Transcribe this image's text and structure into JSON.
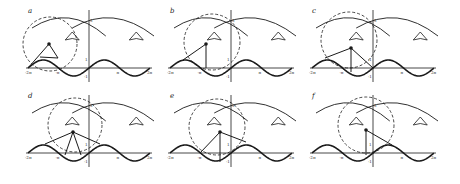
{
  "figure": {
    "stroke_color": "#1a1a1a",
    "background": "#ffffff",
    "axis_ticks": {
      "x": [
        "-2π",
        "-π",
        "π",
        "2π"
      ],
      "y": [
        "1",
        "-1",
        "5"
      ]
    },
    "panels": [
      {
        "label": "a",
        "ox": 89,
        "oy": 68,
        "circle": {
          "cx": 50,
          "cy": 44,
          "r": 27
        },
        "point": {
          "x": 49,
          "y": 44
        },
        "segments": [
          [
            28,
            68,
            49,
            44
          ],
          [
            49,
            44,
            58,
            58
          ],
          [
            40,
            57,
            58,
            58
          ]
        ]
      },
      {
        "label": "b",
        "ox": 231,
        "oy": 68,
        "circle": {
          "cx": 212,
          "cy": 42,
          "r": 28
        },
        "point": {
          "x": 206,
          "y": 44
        },
        "segments": [
          [
            183,
            60,
            206,
            44
          ],
          [
            206,
            44,
            206,
            68
          ]
        ]
      },
      {
        "label": "c",
        "ox": 373,
        "oy": 68,
        "circle": {
          "cx": 349,
          "cy": 40,
          "r": 28
        },
        "point": {
          "x": 351,
          "y": 48
        },
        "segments": [
          [
            325,
            58,
            351,
            48
          ],
          [
            351,
            48,
            351,
            72
          ],
          [
            351,
            48,
            373,
            68
          ]
        ]
      },
      {
        "label": "d",
        "ox": 89,
        "oy": 153,
        "circle": {
          "cx": 75,
          "cy": 125,
          "r": 27
        },
        "point": {
          "x": 73,
          "y": 132
        },
        "segments": [
          [
            45,
            144,
            73,
            132
          ],
          [
            73,
            132,
            100,
            144
          ],
          [
            73,
            132,
            65,
            155
          ],
          [
            73,
            132,
            81,
            155
          ]
        ]
      },
      {
        "label": "e",
        "ox": 231,
        "oy": 153,
        "circle": {
          "cx": 217,
          "cy": 127,
          "r": 28
        },
        "point": {
          "x": 220,
          "y": 132
        },
        "segments": [
          [
            200,
            153,
            220,
            132
          ],
          [
            220,
            132,
            220,
            162
          ],
          [
            220,
            132,
            246,
            142
          ]
        ]
      },
      {
        "label": "f",
        "ox": 373,
        "oy": 153,
        "circle": {
          "cx": 366,
          "cy": 125,
          "r": 28
        },
        "point": {
          "x": 366,
          "y": 130
        },
        "segments": [
          [
            366,
            130,
            366,
            155
          ],
          [
            366,
            130,
            392,
            145
          ]
        ]
      }
    ]
  }
}
